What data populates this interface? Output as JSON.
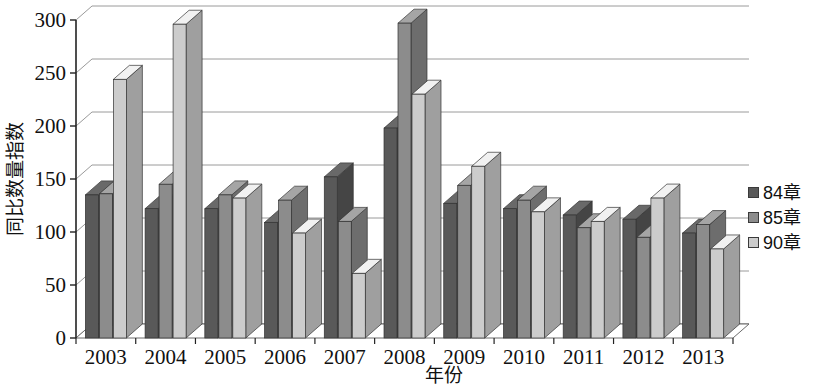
{
  "chart_data": {
    "type": "bar",
    "title": "",
    "xlabel": "年份",
    "ylabel": "同比数量指数",
    "ylim": [
      0,
      300
    ],
    "ytick_step": 50,
    "yticks": [
      "0",
      "50",
      "100",
      "150",
      "200",
      "250",
      "300"
    ],
    "grid": true,
    "legend_position": "right",
    "categories": [
      "2003",
      "2004",
      "2005",
      "2006",
      "2007",
      "2008",
      "2009",
      "2010",
      "2011",
      "2012",
      "2013"
    ],
    "series": [
      {
        "name": "84章",
        "color": "#595959",
        "values": [
          135,
          122,
          122,
          109,
          152,
          198,
          127,
          122,
          116,
          112,
          99
        ]
      },
      {
        "name": "85章",
        "color": "#8c8c8c",
        "values": [
          136,
          145,
          135,
          130,
          110,
          297,
          144,
          130,
          104,
          95,
          107
        ]
      },
      {
        "name": "90章",
        "color": "#cccccc",
        "values": [
          244,
          296,
          132,
          99,
          61,
          230,
          162,
          119,
          110,
          132,
          84
        ]
      }
    ]
  },
  "legend": {
    "items": [
      {
        "label": "84章",
        "swatch": "#595959"
      },
      {
        "label": "85章",
        "swatch": "#8c8c8c"
      },
      {
        "label": "90章",
        "swatch": "#cccccc"
      }
    ]
  },
  "axes": {
    "y_title": "同比数量指数",
    "x_title": "年份"
  }
}
